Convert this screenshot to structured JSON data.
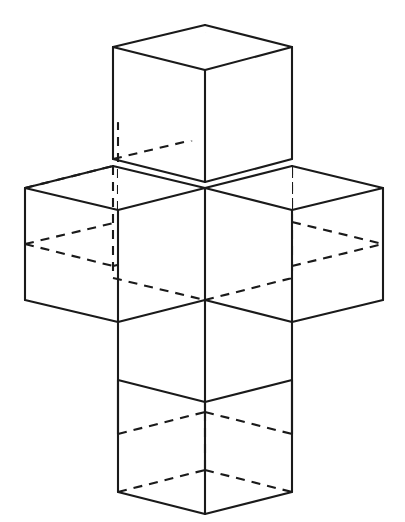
{
  "figure": {
    "background_color": "#ffffff",
    "line_color": "#1a1a1a",
    "solid_line_width": 2.1,
    "hidden_line_dash": "9 7",
    "canvas": {
      "width": 405,
      "height": 522
    }
  },
  "geometry": {
    "notes": "Isometric basis in pixels. Origin is the drawing center. ux is the screen delta for +1 step along cube axis X, uy for +1 step along cube axis Y, uz for +1 step along vertical axis Z.",
    "origin": {
      "x": 205,
      "y": 188
    },
    "ux": {
      "x": 87,
      "y": 22
    },
    "uy": {
      "x": -87,
      "y": 22
    },
    "uz": {
      "x": 0,
      "y": 112
    },
    "cube_half_width_px": 87,
    "cube_depth_rise_px": 22,
    "cube_height_px": 112,
    "center_x_px": 205,
    "top_apex_px": {
      "x": 205,
      "y": 25
    },
    "bottom_apex_px": {
      "x": 205,
      "y": 507
    },
    "left_extreme_px": {
      "x": 25,
      "y": 188
    },
    "right_extreme_px": {
      "x": 383,
      "y": 188
    }
  },
  "cubes": [
    {
      "name": "center-cube",
      "lattice": [
        0,
        0,
        0
      ]
    },
    {
      "name": "top-cube",
      "lattice": [
        0,
        0,
        1
      ]
    },
    {
      "name": "bottom-cube",
      "lattice": [
        0,
        0,
        -1
      ]
    },
    {
      "name": "left-cube",
      "lattice": [
        0,
        1,
        0
      ]
    },
    {
      "name": "right-cube",
      "lattice": [
        1,
        0,
        0
      ]
    },
    {
      "name": "back-cube",
      "lattice": [
        -1,
        0,
        0
      ]
    },
    {
      "name": "front-cube",
      "lattice": [
        0,
        -1,
        0
      ]
    }
  ],
  "edges": {
    "solid": [
      [
        205,
        25,
        113,
        47
      ],
      [
        113,
        47,
        205,
        70
      ],
      [
        205,
        70,
        292,
        47
      ],
      [
        292,
        47,
        205,
        25
      ],
      [
        113,
        47,
        113,
        159
      ],
      [
        292,
        47,
        292,
        159
      ],
      [
        205,
        70,
        205,
        182
      ],
      [
        113,
        159,
        205,
        182
      ],
      [
        205,
        182,
        292,
        159
      ],
      [
        25,
        188,
        113,
        166
      ],
      [
        113,
        166,
        205,
        188
      ],
      [
        205,
        188,
        292,
        166
      ],
      [
        292,
        166,
        383,
        188
      ],
      [
        25,
        188,
        118,
        210
      ],
      [
        118,
        210,
        205,
        188
      ],
      [
        205,
        188,
        292,
        210
      ],
      [
        292,
        210,
        383,
        188
      ],
      [
        25,
        188,
        25,
        300
      ],
      [
        383,
        188,
        383,
        300
      ],
      [
        118,
        210,
        118,
        322
      ],
      [
        292,
        210,
        292,
        322
      ],
      [
        205,
        188,
        205,
        300
      ],
      [
        25,
        300,
        118,
        322
      ],
      [
        118,
        322,
        205,
        300
      ],
      [
        205,
        300,
        292,
        322
      ],
      [
        292,
        322,
        383,
        300
      ],
      [
        118,
        322,
        118,
        434
      ],
      [
        292,
        322,
        292,
        434
      ],
      [
        205,
        300,
        205,
        412
      ],
      [
        118,
        380,
        205,
        402
      ],
      [
        205,
        402,
        292,
        380
      ],
      [
        118,
        380,
        118,
        492
      ],
      [
        292,
        380,
        292,
        492
      ],
      [
        205,
        402,
        205,
        514
      ],
      [
        118,
        492,
        205,
        514
      ],
      [
        205,
        514,
        292,
        492
      ]
    ],
    "hidden": [
      [
        113,
        159,
        205,
        137
      ],
      [
        205,
        137,
        292,
        159
      ],
      [
        205,
        137,
        205,
        25
      ],
      [
        118,
        210,
        118,
        98
      ],
      [
        292,
        210,
        292,
        98
      ],
      [
        25,
        188,
        113,
        166
      ],
      [
        118,
        98,
        205,
        76
      ],
      [
        205,
        76,
        292,
        98
      ],
      [
        113,
        166,
        113,
        278
      ],
      [
        292,
        166,
        292,
        278
      ],
      [
        25,
        244,
        113,
        266
      ],
      [
        113,
        266,
        205,
        244
      ],
      [
        205,
        244,
        292,
        266
      ],
      [
        292,
        266,
        383,
        244
      ],
      [
        25,
        244,
        118,
        222
      ],
      [
        118,
        222,
        205,
        244
      ],
      [
        205,
        244,
        292,
        222
      ],
      [
        292,
        222,
        383,
        244
      ],
      [
        113,
        278,
        205,
        300
      ],
      [
        205,
        300,
        292,
        278
      ],
      [
        118,
        434,
        205,
        412
      ],
      [
        205,
        412,
        292,
        434
      ],
      [
        118,
        492,
        205,
        470
      ],
      [
        205,
        470,
        292,
        492
      ],
      [
        205,
        412,
        205,
        470
      ]
    ]
  }
}
